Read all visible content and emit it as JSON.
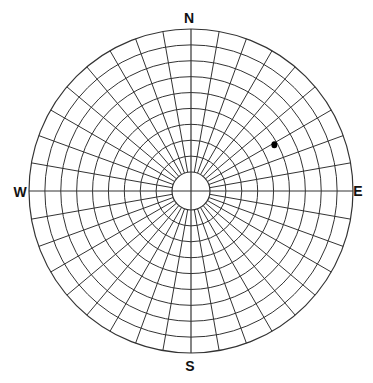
{
  "diagram": {
    "type": "polar-sky-chart",
    "compass_labels": {
      "north": "N",
      "south": "S",
      "east": "E",
      "west": "W"
    },
    "grid": {
      "ring_count": 10,
      "ring_step_degrees": 10,
      "spoke_step_degrees": 10,
      "spoke_count": 36,
      "line_color": "#333333"
    },
    "points": [
      {
        "label": "",
        "azimuth_deg": 61,
        "altitude_deg": 42,
        "color": "#000000"
      }
    ]
  }
}
